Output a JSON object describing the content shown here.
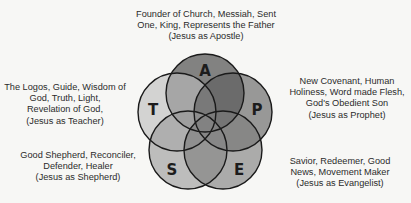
{
  "diagram": {
    "type": "five-circle venn",
    "circles": [
      {
        "id": "A",
        "letter": "A",
        "name": "Apostle",
        "cx": 205,
        "cy": 93,
        "r": 39,
        "fill": "#3a3a3a"
      },
      {
        "id": "T",
        "letter": "T",
        "name": "Teacher",
        "cx": 177,
        "cy": 112,
        "r": 39,
        "fill": "#bdbdbd"
      },
      {
        "id": "P",
        "letter": "P",
        "name": "Prophet",
        "cx": 233,
        "cy": 112,
        "r": 39,
        "fill": "#5e5e5e"
      },
      {
        "id": "S",
        "letter": "S",
        "name": "Shepherd",
        "cx": 188,
        "cy": 150,
        "r": 39,
        "fill": "#9a9a9a"
      },
      {
        "id": "E",
        "letter": "E",
        "name": "Evangelist",
        "cx": 223,
        "cy": 150,
        "r": 39,
        "fill": "#7c7c7c"
      }
    ],
    "stroke_color": "#1a1a1a"
  },
  "labels": {
    "apostle": {
      "lines": [
        "Founder of Church, Messiah, Sent",
        "One, King, Represents the Father",
        "(Jesus as Apostle)"
      ]
    },
    "teacher": {
      "lines": [
        "The Logos, Guide, Wisdom of",
        "God, Truth, Light,",
        "Revelation of God,",
        "(Jesus as Teacher)"
      ]
    },
    "prophet": {
      "lines": [
        "New Covenant, Human",
        "Holiness, Word made Flesh,",
        "God's Obedient Son",
        "(Jesus as Prophet)"
      ]
    },
    "shepherd": {
      "lines": [
        "Good Shepherd, Reconciler,",
        "Defender, Healer",
        "(Jesus as Shepherd)"
      ]
    },
    "evangelist": {
      "lines": [
        "Savior, Redeemer, Good",
        "News, Movement Maker",
        "(Jesus as Evangelist)"
      ]
    }
  }
}
